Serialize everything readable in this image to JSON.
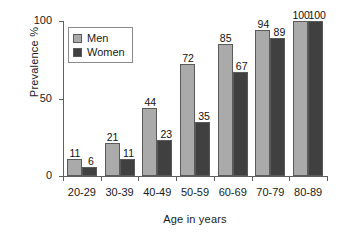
{
  "chart_data": {
    "type": "bar",
    "title": "",
    "xlabel": "Age in years",
    "ylabel": "Prevalence %",
    "categories": [
      "20-29",
      "30-39",
      "40-49",
      "50-59",
      "60-69",
      "70-79",
      "80-89"
    ],
    "series": [
      {
        "name": "Men",
        "color": "#aaaaaa",
        "values": [
          11,
          21,
          44,
          72,
          85,
          94,
          100
        ]
      },
      {
        "name": "Women",
        "color": "#404040",
        "values": [
          6,
          11,
          23,
          35,
          67,
          89,
          100
        ]
      }
    ],
    "ylim": [
      0,
      100
    ],
    "yticks": [
      0,
      50,
      100
    ],
    "ytick_labels": [
      "0",
      "50",
      "100"
    ],
    "grid": false,
    "legend_position": "top-left",
    "data_labels": true
  },
  "legend": {
    "items": [
      {
        "label": "Men"
      },
      {
        "label": "Women"
      }
    ]
  }
}
